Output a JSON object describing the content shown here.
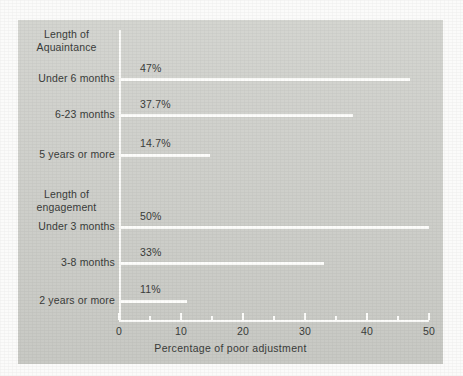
{
  "chart_data": {
    "type": "bar",
    "orientation": "horizontal",
    "title": "",
    "xlabel": "Percentage of poor adjustment",
    "ylabel": "",
    "xlim": [
      0,
      50
    ],
    "xticks": [
      0,
      10,
      20,
      30,
      40,
      50
    ],
    "xtick_labels": [
      "0",
      "10",
      "20",
      "30",
      "40",
      "50"
    ],
    "minor_ticks": [
      5,
      15,
      25,
      35,
      45
    ],
    "grid": false,
    "legend": null,
    "groups": [
      {
        "header_line1": "Length of",
        "header_line2": "Aquaintance",
        "categories": [
          "Under 6 months",
          "6-23 months",
          "5 years or more"
        ],
        "values": [
          47,
          37.7,
          14.7
        ],
        "value_labels": [
          "47%",
          "37.7%",
          "14.7%"
        ]
      },
      {
        "header_line1": "Length of",
        "header_line2": "engagement",
        "categories": [
          "Under 3 months",
          "3-8 months",
          "2 years or more"
        ],
        "values": [
          50,
          33,
          11
        ],
        "value_labels": [
          "50%",
          "33%",
          "11%"
        ]
      }
    ],
    "categories": [
      "Under 6 months",
      "6-23 months",
      "5 years or more",
      "Under 3 months",
      "3-8 months",
      "2 years or more"
    ],
    "values": [
      47,
      37.7,
      14.7,
      50,
      33,
      11
    ],
    "value_labels": [
      "47%",
      "37.7%",
      "14.7%",
      "50%",
      "33%",
      "11%"
    ],
    "colors": {
      "panel_background": "#cfd0cb",
      "page_background": "#fbfbfa",
      "bar": "#fdfdfb",
      "axis": "#fdfdfb",
      "text": "#3a3c3a"
    }
  },
  "group_a": {
    "header_line1": "Length of",
    "header_line2": "Aquaintance",
    "row0": {
      "label": "Under 6 months",
      "value": "47%"
    },
    "row1": {
      "label": "6-23 months",
      "value": "37.7%"
    },
    "row2": {
      "label": "5 years or more",
      "value": "14.7%"
    }
  },
  "group_b": {
    "header_line1": "Length of",
    "header_line2": "engagement",
    "row0": {
      "label": "Under 3 months",
      "value": "50%"
    },
    "row1": {
      "label": "3-8 months",
      "value": "33%"
    },
    "row2": {
      "label": "2 years or more",
      "value": "11%"
    }
  },
  "axis": {
    "t0": "0",
    "t1": "10",
    "t2": "20",
    "t3": "30",
    "t4": "40",
    "t5": "50",
    "xlabel": "Percentage of poor adjustment"
  }
}
